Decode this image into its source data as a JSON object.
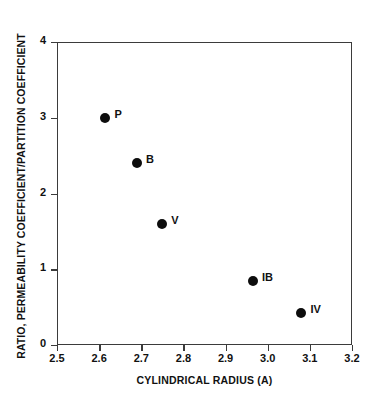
{
  "chart_data": {
    "type": "scatter",
    "title": "",
    "xlabel": "CYLINDRICAL RADIUS (A)",
    "ylabel": "RATIO, PERMEABILITY COEFFICIENT/PARTITION COEFFICIENT",
    "xlim": [
      2.5,
      3.2
    ],
    "ylim": [
      0,
      4
    ],
    "xticks": [
      "2.5",
      "2.6",
      "2.7",
      "2.8",
      "2.9",
      "3.0",
      "3.1",
      "3.2"
    ],
    "xtick_values": [
      2.5,
      2.6,
      2.7,
      2.8,
      2.9,
      3.0,
      3.1,
      3.2
    ],
    "yticks": [
      "0",
      "1",
      "2",
      "3",
      "4"
    ],
    "ytick_values": [
      0,
      1,
      2,
      3,
      4
    ],
    "grid": false,
    "legend": "none",
    "marker_color": "#0d0d0d",
    "axis_color": "#3b3b3b",
    "points": [
      {
        "label": "P",
        "x": 2.615,
        "y": 3.0
      },
      {
        "label": "B",
        "x": 2.69,
        "y": 2.4
      },
      {
        "label": "V",
        "x": 2.75,
        "y": 1.6
      },
      {
        "label": "IB",
        "x": 2.965,
        "y": 0.85
      },
      {
        "label": "IV",
        "x": 3.08,
        "y": 0.42
      }
    ]
  }
}
